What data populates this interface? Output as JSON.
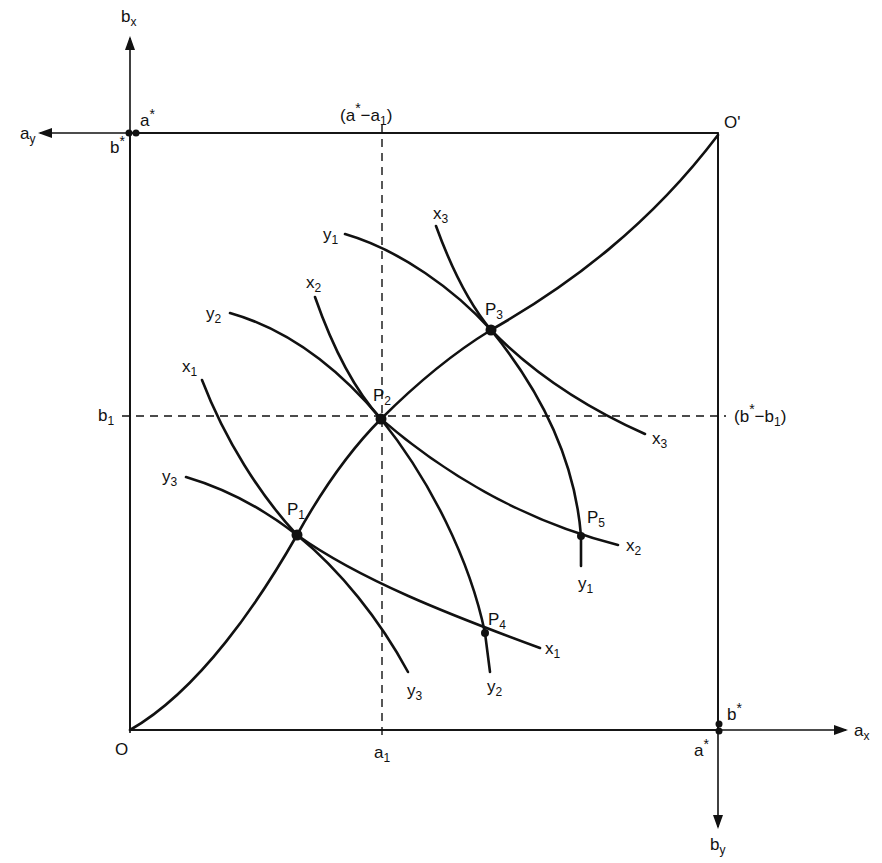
{
  "diagram": {
    "type": "edgeworth-box",
    "origins": {
      "x_origin": {
        "label": "O",
        "x": 130,
        "y": 730
      },
      "y_origin": {
        "label": "O'",
        "x": 718,
        "y": 135
      }
    },
    "axes": {
      "ax": {
        "label": "a",
        "sub": "x"
      },
      "bx": {
        "label": "b",
        "sub": "x"
      },
      "ay": {
        "label": "a",
        "sub": "y"
      },
      "by": {
        "label": "b",
        "sub": "y"
      }
    },
    "endowment_marks": {
      "top_left": {
        "a_star": "a*",
        "b_star": "b*"
      },
      "bottom_right": {
        "a_star": "a*",
        "b_star": "b*"
      }
    },
    "guide_labels": {
      "a1": {
        "base": "a",
        "sub": "1"
      },
      "b1": {
        "base": "b",
        "sub": "1"
      },
      "a_star_minus_a1": {
        "text": "(a* − a1)",
        "open": "(",
        "base": "a",
        "star": "*",
        "minus": "−",
        "base2": "a",
        "sub": "1",
        "close": ")"
      },
      "b_star_minus_b1": {
        "text": "(b* − b1)",
        "open": "(",
        "base": "b",
        "star": "*",
        "minus": "−",
        "base2": "b",
        "sub": "1",
        "close": ")"
      }
    },
    "points": [
      {
        "id": "P1",
        "label": "P",
        "sub": "1",
        "x": 297,
        "y": 535
      },
      {
        "id": "P2",
        "label": "P",
        "sub": "2",
        "x": 381,
        "y": 419
      },
      {
        "id": "P3",
        "label": "P",
        "sub": "3",
        "x": 491,
        "y": 330
      },
      {
        "id": "P4",
        "label": "P",
        "sub": "4",
        "x": 485,
        "y": 633
      },
      {
        "id": "P5",
        "label": "P",
        "sub": "5",
        "x": 581,
        "y": 536
      }
    ],
    "indifference_curves": {
      "x": [
        {
          "id": "x1",
          "label": "x",
          "sub": "1"
        },
        {
          "id": "x2",
          "label": "x",
          "sub": "2"
        },
        {
          "id": "x3",
          "label": "x",
          "sub": "3"
        }
      ],
      "y": [
        {
          "id": "y1",
          "label": "y",
          "sub": "1"
        },
        {
          "id": "y2",
          "label": "y",
          "sub": "2"
        },
        {
          "id": "y3",
          "label": "y",
          "sub": "3"
        }
      ]
    },
    "contract_curve": {
      "from": "O",
      "through": [
        "P1",
        "P2",
        "P3"
      ],
      "to": "O'"
    }
  }
}
